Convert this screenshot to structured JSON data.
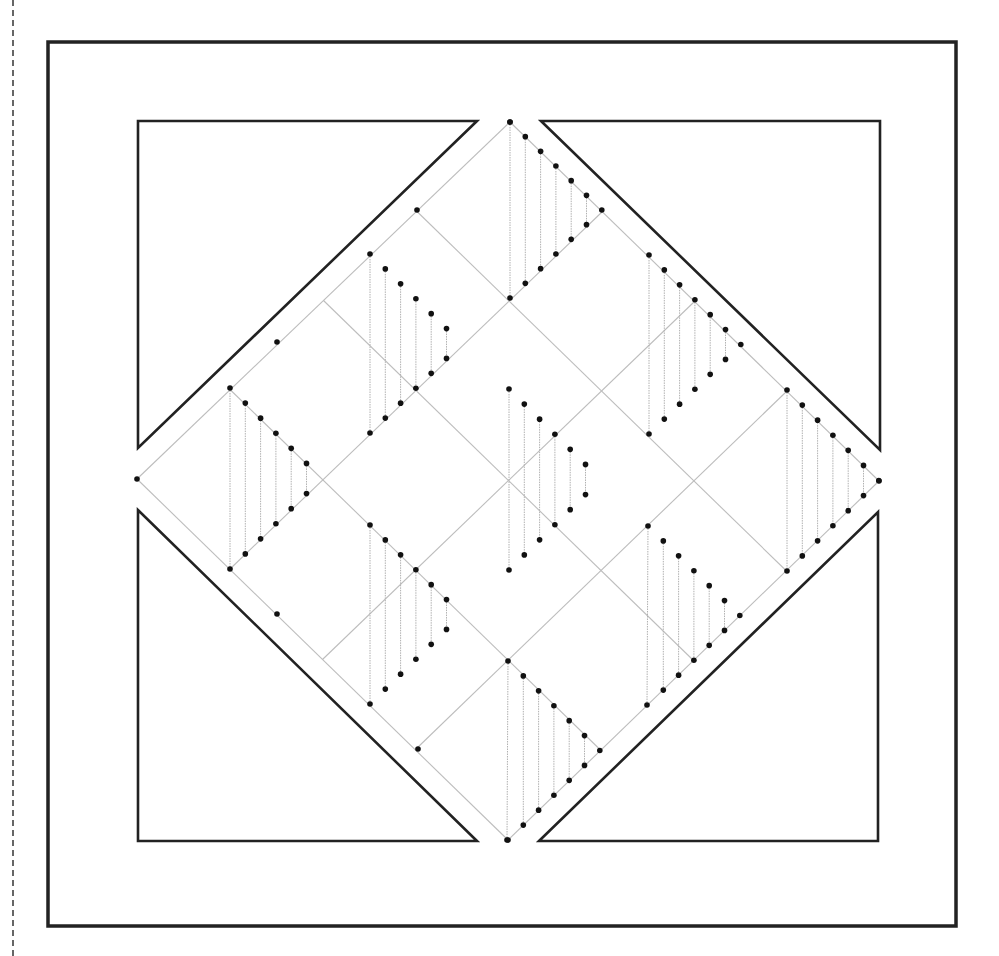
{
  "page": {
    "width": 999,
    "height": 956,
    "margin_rule": "dashed"
  },
  "colors": {
    "frame": "#222222",
    "grid": "#bdbdbd",
    "hatch": "#b0b0b0",
    "dot": "#111111",
    "background": "#ffffff"
  },
  "frame": {
    "x": 48,
    "y": 42,
    "width": 908,
    "height": 884
  },
  "corner_triangles": [
    {
      "name": "top-left",
      "points": [
        [
          138,
          121
        ],
        [
          477,
          121
        ],
        [
          138,
          448
        ]
      ]
    },
    {
      "name": "top-right",
      "points": [
        [
          541,
          121
        ],
        [
          880,
          121
        ],
        [
          880,
          450
        ]
      ]
    },
    {
      "name": "bottom-left",
      "points": [
        [
          138,
          510
        ],
        [
          138,
          841
        ],
        [
          477,
          841
        ]
      ]
    },
    {
      "name": "bottom-right",
      "points": [
        [
          539,
          841
        ],
        [
          878,
          841
        ],
        [
          878,
          512
        ]
      ]
    }
  ],
  "diamond": {
    "top": [
      510,
      122
    ],
    "right": [
      879,
      481
    ],
    "bottom": [
      508,
      840
    ],
    "left": [
      137,
      479
    ]
  },
  "grid": {
    "divisions": 4
  },
  "edge_dots": [
    [
      510,
      122
    ],
    [
      137,
      479
    ],
    [
      879,
      481
    ],
    [
      508,
      840
    ],
    [
      417,
      210
    ],
    [
      277,
      342
    ],
    [
      277,
      614
    ],
    [
      418,
      749
    ]
  ],
  "hatched_triangles": [
    {
      "apex": [
        510,
        122
      ],
      "bottom": [
        510,
        298
      ],
      "vertex_dot": true
    },
    {
      "apex": [
        370,
        254
      ],
      "bottom": [
        370,
        433
      ],
      "vertex_dot": false
    },
    {
      "apex": [
        649,
        255
      ],
      "bottom": [
        649,
        434
      ],
      "vertex_dot": true
    },
    {
      "apex": [
        230,
        388
      ],
      "bottom": [
        230,
        569
      ],
      "vertex_dot": false
    },
    {
      "apex": [
        509,
        389
      ],
      "bottom": [
        509,
        570
      ],
      "vertex_dot": false
    },
    {
      "apex": [
        787,
        390
      ],
      "bottom": [
        787,
        571
      ],
      "vertex_dot": true
    },
    {
      "apex": [
        370,
        525
      ],
      "bottom": [
        370,
        704
      ],
      "vertex_dot": false
    },
    {
      "apex": [
        648,
        526
      ],
      "bottom": [
        647,
        705
      ],
      "vertex_dot": true
    },
    {
      "apex": [
        508,
        661
      ],
      "bottom": [
        507,
        840
      ],
      "vertex_dot": true
    }
  ],
  "hatch_steps": 5,
  "hatch_spacing": 15.3
}
